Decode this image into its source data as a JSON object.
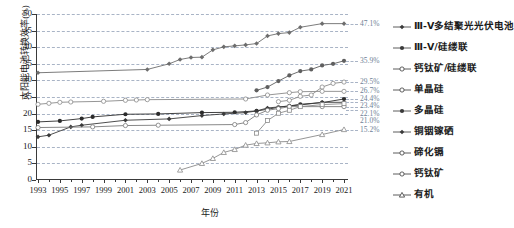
{
  "chart_data": {
    "type": "line",
    "title": "",
    "xlabel": "年份",
    "ylabel": "太阳能电池转换效率(%)",
    "xlim": [
      1993,
      2021
    ],
    "ylim": [
      0,
      50
    ],
    "grid": true,
    "legend_position": "right",
    "xticks": [
      "1993",
      "1995",
      "1997",
      "1999",
      "2001",
      "2003",
      "2005",
      "2007",
      "2009",
      "2011",
      "2013",
      "2015",
      "2017",
      "2019",
      "2021"
    ],
    "yticks": [
      "0",
      "5",
      "10",
      "15",
      "20",
      "25",
      "30",
      "35",
      "40",
      "45",
      "50"
    ],
    "series": [
      {
        "name": "Ⅲ-Ⅴ多结聚光光伏电池",
        "marker": "filled-diamond",
        "color": "#6d6d6d",
        "end_value": "47.1%",
        "points": [
          [
            1993,
            32.3
          ],
          [
            2003,
            33.3
          ],
          [
            2005,
            35.0
          ],
          [
            2006,
            36.3
          ],
          [
            2007,
            36.9
          ],
          [
            2008,
            37.0
          ],
          [
            2009,
            39.2
          ],
          [
            2010,
            40.1
          ],
          [
            2011,
            40.4
          ],
          [
            2012,
            40.7
          ],
          [
            2013,
            41.1
          ],
          [
            2014,
            43.4
          ],
          [
            2015,
            44.1
          ],
          [
            2016,
            44.4
          ],
          [
            2017,
            46.0
          ],
          [
            2019,
            47.1
          ],
          [
            2021,
            47.1
          ]
        ]
      },
      {
        "name": "Ⅲ-Ⅴ/硅缕联",
        "marker": "filled-circle",
        "color": "#5f5f5f",
        "end_value": "35.9%",
        "points": [
          [
            2013,
            27.0
          ],
          [
            2014,
            28.0
          ],
          [
            2015,
            29.8
          ],
          [
            2016,
            31.5
          ],
          [
            2017,
            32.8
          ],
          [
            2018,
            33.3
          ],
          [
            2019,
            34.5
          ],
          [
            2020,
            35.0
          ],
          [
            2021,
            35.9
          ]
        ]
      },
      {
        "name": "钙钛矿/硅缕联",
        "marker": "open-circle",
        "color": "#8a8a8a",
        "end_value": "29.5%",
        "points": [
          [
            2015,
            23.6
          ],
          [
            2016,
            24.0
          ],
          [
            2017,
            25.2
          ],
          [
            2018,
            25.6
          ],
          [
            2019,
            28.0
          ],
          [
            2020,
            29.1
          ],
          [
            2021,
            29.5
          ]
        ]
      },
      {
        "name": "单晶硅",
        "marker": "open-circle",
        "color": "#8a8a8a",
        "end_value": "26.7%",
        "points": [
          [
            1993,
            22.8
          ],
          [
            1994,
            23.1
          ],
          [
            1995,
            23.4
          ],
          [
            1996,
            23.5
          ],
          [
            1999,
            23.7
          ],
          [
            2001,
            24.0
          ],
          [
            2002,
            24.1
          ],
          [
            2003,
            24.2
          ],
          [
            2012,
            24.4
          ],
          [
            2014,
            25.6
          ],
          [
            2016,
            26.3
          ],
          [
            2017,
            26.6
          ],
          [
            2019,
            26.7
          ],
          [
            2021,
            26.7
          ]
        ]
      },
      {
        "name": "多晶硅",
        "marker": "filled-circle",
        "color": "#2b2b2b",
        "end_value": "24.4%",
        "points": [
          [
            1993,
            17.5
          ],
          [
            1995,
            17.8
          ],
          [
            1997,
            18.5
          ],
          [
            1998,
            19.0
          ],
          [
            2001,
            19.8
          ],
          [
            2004,
            19.9
          ],
          [
            2008,
            20.3
          ],
          [
            2011,
            20.4
          ],
          [
            2013,
            20.8
          ],
          [
            2014,
            21.3
          ],
          [
            2015,
            21.9
          ],
          [
            2016,
            22.3
          ],
          [
            2017,
            22.8
          ],
          [
            2019,
            23.3
          ],
          [
            2021,
            24.4
          ]
        ]
      },
      {
        "name": "铜铟镓硒",
        "marker": "filled-diamond",
        "color": "#3a3a3a",
        "end_value": "23.4%",
        "points": [
          [
            1993,
            13.0
          ],
          [
            1994,
            13.5
          ],
          [
            1996,
            16.0
          ],
          [
            1997,
            16.5
          ],
          [
            2001,
            18.0
          ],
          [
            2005,
            18.4
          ],
          [
            2008,
            19.4
          ],
          [
            2010,
            19.9
          ],
          [
            2012,
            20.3
          ],
          [
            2013,
            20.8
          ],
          [
            2014,
            21.7
          ],
          [
            2016,
            22.3
          ],
          [
            2017,
            22.6
          ],
          [
            2019,
            23.4
          ],
          [
            2021,
            23.4
          ]
        ]
      },
      {
        "name": "碲化镉",
        "marker": "open-circle",
        "color": "#7a7a7a",
        "end_value": "22.1%",
        "points": [
          [
            1993,
            15.8
          ],
          [
            1998,
            16.0
          ],
          [
            2001,
            16.4
          ],
          [
            2004,
            16.5
          ],
          [
            2011,
            16.7
          ],
          [
            2012,
            17.3
          ],
          [
            2013,
            19.6
          ],
          [
            2014,
            21.0
          ],
          [
            2015,
            21.5
          ],
          [
            2016,
            22.1
          ],
          [
            2019,
            22.1
          ],
          [
            2021,
            22.1
          ]
        ]
      },
      {
        "name": "钙钛矿",
        "marker": "open-square",
        "color": "#8a8a8a",
        "end_value": "21.0%",
        "points": [
          [
            2013,
            14.1
          ],
          [
            2014,
            17.9
          ],
          [
            2015,
            20.1
          ],
          [
            2016,
            21.0
          ],
          [
            2017,
            22.1
          ],
          [
            2019,
            22.7
          ],
          [
            2021,
            23.0
          ]
        ]
      },
      {
        "name": "有机",
        "marker": "open-triangle",
        "color": "#8a8a8a",
        "end_value": "15.2%",
        "points": [
          [
            2006,
            3.0
          ],
          [
            2008,
            5.0
          ],
          [
            2009,
            6.5
          ],
          [
            2010,
            8.3
          ],
          [
            2011,
            9.2
          ],
          [
            2012,
            10.5
          ],
          [
            2013,
            11.0
          ],
          [
            2014,
            11.2
          ],
          [
            2015,
            11.5
          ],
          [
            2016,
            11.6
          ],
          [
            2019,
            13.7
          ],
          [
            2021,
            15.2
          ]
        ]
      }
    ],
    "legend_items": [
      {
        "label": "Ⅲ-Ⅴ多结聚光光伏电池",
        "marker": "filled-diamond"
      },
      {
        "label": "Ⅲ-Ⅴ/硅缕联",
        "marker": "filled-circle"
      },
      {
        "label": "钙钛矿/硅缕联",
        "marker": "open-circle"
      },
      {
        "label": "单晶硅",
        "marker": "open-circle"
      },
      {
        "label": "多晶硅",
        "marker": "filled-circle"
      },
      {
        "label": "铜铟镓硒",
        "marker": "filled-diamond"
      },
      {
        "label": "碲化镉",
        "marker": "open-circle"
      },
      {
        "label": "钙钛矿",
        "marker": "open-circle"
      },
      {
        "label": "有机",
        "marker": "open-triangle"
      }
    ],
    "end_labels": [
      {
        "value": "47.1%",
        "y": 47.1
      },
      {
        "value": "35.9%",
        "y": 35.9
      },
      {
        "value": "29.5%",
        "y": 29.5
      },
      {
        "value": "26.7%",
        "y": 26.7
      },
      {
        "value": "24.4%",
        "y": 24.4
      },
      {
        "value": "23.4%",
        "y": 23.4
      },
      {
        "value": "22.1%",
        "y": 22.1
      },
      {
        "value": "21.0%",
        "y": 21.0
      },
      {
        "value": "15.2%",
        "y": 15.2
      }
    ]
  }
}
